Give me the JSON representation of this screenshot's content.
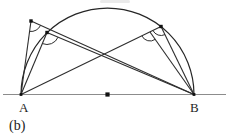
{
  "figure": {
    "caption": "(b)",
    "labels": {
      "A": "A",
      "B": "B"
    },
    "colors": {
      "line": "#2e2e2e",
      "arc": "#262626",
      "baseline": "#8c8c8c",
      "dot": "#111111",
      "label": "#1e1e1e",
      "background": "#ffffff"
    },
    "geometry": {
      "width": 229,
      "height": 140,
      "baseline": {
        "x1": 3,
        "x2": 226,
        "y": 94.5
      },
      "radius": 86.5,
      "points": {
        "A": [
          21,
          94.5
        ],
        "B": [
          194,
          94.5
        ],
        "O": [
          107.5,
          94.5
        ],
        "P1": [
          31,
          21
        ],
        "P2": [
          47,
          32.5
        ],
        "Q1": [
          161,
          26.5
        ],
        "Q2": [
          150,
          32
        ]
      },
      "semicircle": {
        "from": "A",
        "to": "B"
      },
      "segments": [
        [
          "A",
          "P1"
        ],
        [
          "A",
          "P2"
        ],
        [
          "B",
          "P1"
        ],
        [
          "B",
          "P2"
        ],
        [
          "A",
          "Q1"
        ],
        [
          "B",
          "Q1"
        ],
        [
          "B",
          "Q2"
        ]
      ],
      "angle_marks": [
        {
          "at": "P1",
          "toward": [
            "A",
            "B"
          ],
          "r": 10.5
        },
        {
          "at": "P2",
          "toward": [
            "A",
            "B"
          ],
          "r": 12
        },
        {
          "at": "Q1",
          "toward": [
            "A",
            "B"
          ],
          "r": 9
        },
        {
          "at": "Q2",
          "toward": [
            "A",
            "B"
          ],
          "r": 9
        }
      ],
      "dots": [
        {
          "at": "P1",
          "size": 3.4
        },
        {
          "at": "P2",
          "size": 3.4
        },
        {
          "at": "Q1",
          "size": 3.4
        },
        {
          "at": "A",
          "size": 2.8
        },
        {
          "at": "B",
          "size": 2.8
        },
        {
          "at": "O",
          "size": 4.2
        }
      ]
    }
  }
}
